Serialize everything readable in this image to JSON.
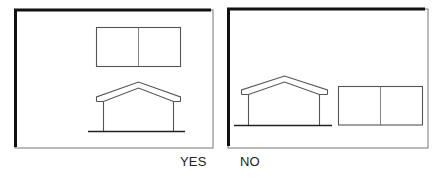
{
  "figure": {
    "panels": [
      {
        "label": "YES",
        "arrangement": "garage rectangle placed above house (set back)",
        "elements": [
          "garage-rectangle",
          "house-elevation",
          "ground-line"
        ]
      },
      {
        "label": "NO",
        "arrangement": "garage rectangle placed beside house at same ground level",
        "elements": [
          "house-elevation",
          "ground-line",
          "garage-rectangle"
        ]
      }
    ]
  },
  "captions": {
    "yes": "YES",
    "no": "NO"
  },
  "colors": {
    "line": "#555555",
    "frame_heavy": "#111111",
    "frame_light": "#777777",
    "background": "#ffffff"
  }
}
